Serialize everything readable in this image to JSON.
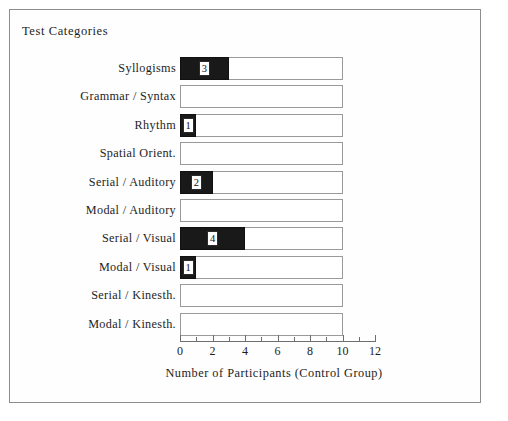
{
  "figure": {
    "title": "Test Categories",
    "frame_color": "#8d8d8d",
    "background": "#ffffff"
  },
  "chart_data": {
    "type": "bar",
    "orientation": "horizontal",
    "title": "Test Categories",
    "xlabel": "Number of Participants (Control Group)",
    "ylabel": "Test Categories",
    "xlim": [
      0,
      12
    ],
    "xticks": [
      0,
      2,
      4,
      6,
      8,
      10,
      12
    ],
    "xtick_labels": [
      "0",
      "2",
      "4",
      "6",
      "8",
      "10",
      "12"
    ],
    "minor_tick_step": 1,
    "grid": false,
    "legend": null,
    "track_max": 10,
    "bar_fill_color": "#191919",
    "bar_track_color": "#ffffff",
    "bar_outline_color": "#9a9a9a",
    "categories": [
      "Syllogisms",
      "Grammar / Syntax",
      "Rhythm",
      "Spatial  Orient.",
      "Serial / Auditory",
      "Modal / Auditory",
      "Serial / Visual",
      "Modal / Visual",
      "Serial / Kinesth.",
      "Modal / Kinesth."
    ],
    "values": [
      3,
      0,
      1,
      0,
      2,
      0,
      4,
      1,
      0,
      0
    ],
    "value_labels": [
      "3",
      "",
      "1",
      "",
      "2",
      "",
      "4",
      "1",
      "",
      ""
    ]
  }
}
